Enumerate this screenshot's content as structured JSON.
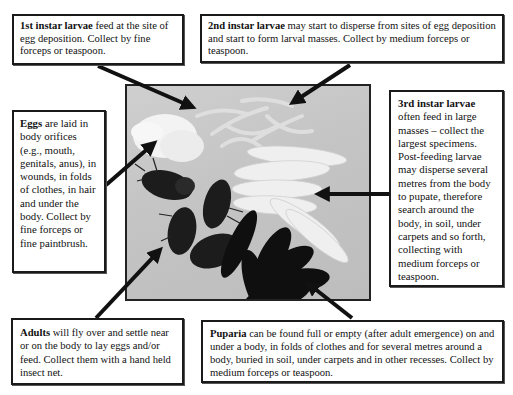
{
  "diagram": {
    "colors": {
      "border": "#1a1a1a",
      "arrow": "#111111",
      "photo_bg": "#c6c6c6"
    },
    "boxes": {
      "first_instar": {
        "title": "1st instar larvae",
        "text": " feed at the site of egg deposition.  Collect by fine forceps or teaspoon."
      },
      "second_instar": {
        "title": "2nd instar larvae",
        "text": " may start to disperse from sites of egg deposition and start to form larval masses. Collect by medium forceps or teaspoon."
      },
      "eggs": {
        "title": "Eggs",
        "text": " are laid in body orifices (e.g., mouth, genitals, anus), in wounds, in folds of clothes, in hair and under the body. Collect by fine forceps or fine paintbrush."
      },
      "third_instar": {
        "title": "3rd instar larvae",
        "text": " often feed in large masses – collect the largest specimens. Post-feeding larvae may disperse several metres from the body to pupate, therefore search around the body, in soil, under carpets and so forth, collecting with medium forceps or teaspoon."
      },
      "adults": {
        "title": "Adults",
        "text": " will fly over and settle near or on the body to lay eggs and/or feed. Collect them with a hand held insect net."
      },
      "puparia": {
        "title": "Puparia",
        "text": " can be found full or empty (after adult emergence) on and under a body, in folds of clothes and for several metres around a body, buried in soil, under carpets and in other recesses. Collect by medium forceps or teaspoon."
      }
    },
    "photo": {
      "description": "Photograph of fly eggs, larvae (1st–3rd instar), adult flies and dark puparia",
      "elements": [
        "egg-mass",
        "first-instar-larvae",
        "second-instar-larvae",
        "third-instar-larvae",
        "adult-flies",
        "puparia"
      ]
    }
  }
}
